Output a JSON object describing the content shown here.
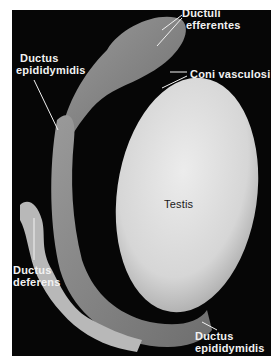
{
  "figure": {
    "labels": {
      "ductuli_efferentes": {
        "line1": "Ductuli",
        "line2": "efferentes"
      },
      "coni_vasculosi": {
        "line1": "Coni vasculosi"
      },
      "ductus_epididymidis_top": {
        "line1": "Ductus",
        "line2": "epididymidis"
      },
      "testis": {
        "line1": "Testis"
      },
      "ductus_deferens": {
        "line1": "Ductus",
        "line2": "deferens"
      },
      "ductus_epididymidis_bottom": {
        "line1": "Ductus",
        "line2": "epididymidis"
      }
    },
    "colors": {
      "background": "#060606",
      "testis": "#dcdcdc",
      "tissue": "#8a8a8a",
      "label_text": "#f2f2f2"
    }
  }
}
